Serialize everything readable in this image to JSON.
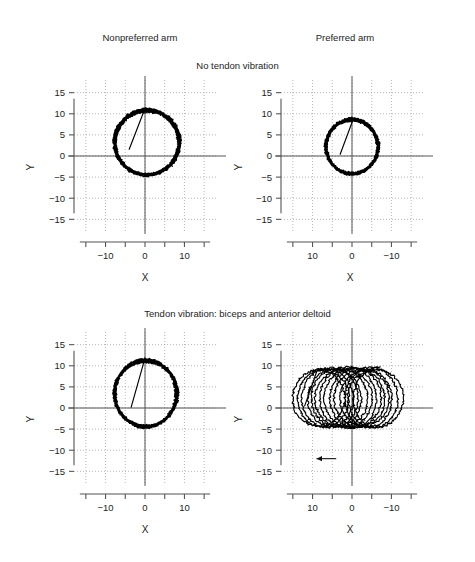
{
  "figure": {
    "column_headers": [
      {
        "label": "Nonpreferred arm"
      },
      {
        "label": "Preferred arm"
      }
    ],
    "row_titles": [
      {
        "label": "No tendon vibration"
      },
      {
        "label": "Tendon vibration: biceps and anterior deltoid"
      }
    ],
    "axis_title_x": "X",
    "axis_title_y": "Y",
    "annotation": {
      "name": "drift-arrow",
      "direction": "left",
      "label": ""
    }
  },
  "chart_data": [
    {
      "type": "line",
      "title": "No tendon vibration",
      "subtitle": "Nonpreferred arm",
      "panel": "top-left",
      "xlabel": "X",
      "ylabel": "Y",
      "xlim": [
        -18,
        18
      ],
      "ylim": [
        18,
        -18
      ],
      "x_reversed": false,
      "y_reversed": true,
      "xticks": [
        -10,
        0,
        10
      ],
      "xticks_minor": [
        -15,
        -5,
        5,
        15
      ],
      "yticks": [
        -15,
        -10,
        -5,
        0,
        5,
        10,
        15
      ],
      "grid": true,
      "legend": "none",
      "description": "Repeated circular arm trajectories, no drift; loops centered near (0, 3) with radius about 8.",
      "trajectory": {
        "cycles": 14,
        "center_x": 0.5,
        "center_y": 3.2,
        "radius_x": 8.2,
        "radius_y": 7.6,
        "drift_per_cycle_x": 0.0,
        "drift_per_cycle_y": 0.0,
        "jitter": 0.55,
        "start_point": [
          -4.0,
          1.6
        ]
      }
    },
    {
      "type": "line",
      "title": "No tendon vibration",
      "subtitle": "Preferred arm",
      "panel": "top-right",
      "xlabel": "X",
      "ylabel": "Y",
      "xlim": [
        18,
        -18
      ],
      "ylim": [
        18,
        -18
      ],
      "x_reversed": true,
      "y_reversed": true,
      "xticks": [
        10,
        0,
        -10
      ],
      "xticks_minor": [
        15,
        5,
        -5,
        -15
      ],
      "yticks": [
        -15,
        -10,
        -5,
        0,
        5,
        10,
        15
      ],
      "grid": true,
      "legend": "none",
      "description": "Repeated circular arm trajectories, no drift; tighter loops centered near (0, 2) with radius about 6.5.",
      "trajectory": {
        "cycles": 14,
        "center_x": 0.0,
        "center_y": 2.2,
        "radius_x": 6.6,
        "radius_y": 6.4,
        "drift_per_cycle_x": 0.0,
        "drift_per_cycle_y": 0.0,
        "jitter": 0.45,
        "start_point": [
          3.0,
          0.4
        ]
      }
    },
    {
      "type": "line",
      "title": "Tendon vibration: biceps and anterior deltoid",
      "subtitle": "Nonpreferred arm",
      "panel": "bottom-left",
      "xlabel": "X",
      "ylabel": "Y",
      "xlim": [
        -18,
        18
      ],
      "ylim": [
        18,
        -18
      ],
      "x_reversed": false,
      "y_reversed": true,
      "xticks": [
        -10,
        0,
        10
      ],
      "xticks_minor": [
        -15,
        -5,
        5,
        15
      ],
      "yticks": [
        -15,
        -10,
        -5,
        0,
        5,
        10,
        15
      ],
      "grid": true,
      "legend": "none",
      "description": "Repeated circular arm trajectories with minimal drift; loops centered near (0, 3) with radius about 8.",
      "trajectory": {
        "cycles": 14,
        "center_x": 0.2,
        "center_y": 3.4,
        "radius_x": 7.9,
        "radius_y": 7.8,
        "drift_per_cycle_x": 0.0,
        "drift_per_cycle_y": 0.0,
        "jitter": 0.5,
        "start_point": [
          -3.5,
          0.2
        ]
      }
    },
    {
      "type": "line",
      "title": "Tendon vibration: biceps and anterior deltoid",
      "subtitle": "Preferred arm",
      "panel": "bottom-right",
      "xlabel": "X",
      "ylabel": "Y",
      "xlim": [
        18,
        -18
      ],
      "ylim": [
        18,
        -18
      ],
      "x_reversed": true,
      "y_reversed": true,
      "xticks": [
        10,
        0,
        -10
      ],
      "xticks_minor": [
        15,
        5,
        -5,
        -15
      ],
      "yticks": [
        -15,
        -10,
        -5,
        0,
        5,
        10,
        15
      ],
      "grid": true,
      "legend": "none",
      "description": "Repeated circular trajectories drifting progressively toward negative X, producing a wide horizontal band; arrow marks drift direction.",
      "trajectory": {
        "cycles": 14,
        "center_x": 9.0,
        "center_y": 2.4,
        "radius_x": 6.6,
        "radius_y": 7.0,
        "drift_per_cycle_x": -1.15,
        "drift_per_cycle_y": 0.0,
        "jitter": 0.5,
        "start_point": [
          12.0,
          0.5
        ]
      },
      "annotation_arrow": {
        "x_start": 4.0,
        "x_end": 9.0,
        "y": -12.0,
        "points": "left"
      }
    }
  ],
  "style": {
    "trace_color": "#000000",
    "axis_color": "#555555",
    "grid_color": "#9a9a9a",
    "text_color": "#1d1d1d",
    "background": "#ffffff"
  }
}
